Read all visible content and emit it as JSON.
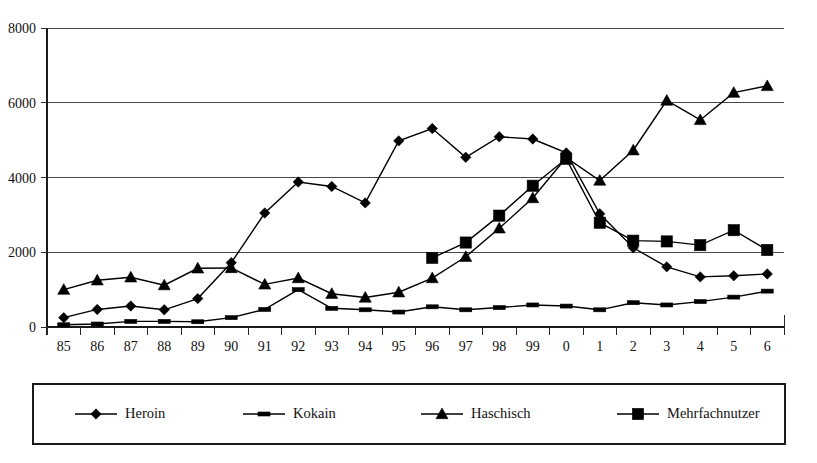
{
  "chart_data": {
    "type": "line",
    "title": "",
    "subtitle": "",
    "xlabel": "",
    "ylabel": "",
    "xlim_categories_count": 22,
    "ylim": [
      0,
      8000
    ],
    "y_ticks": [
      "0",
      "2000",
      "4000",
      "6000",
      "8000"
    ],
    "y_tick_values": [
      0,
      2000,
      4000,
      6000,
      8000
    ],
    "grid": "horizontal",
    "legend_position": "bottom",
    "categories": [
      "85",
      "86",
      "87",
      "88",
      "89",
      "90",
      "91",
      "92",
      "93",
      "94",
      "95",
      "96",
      "97",
      "98",
      "99",
      "0",
      "1",
      "2",
      "3",
      "4",
      "5",
      "6"
    ],
    "series": [
      {
        "name": "Heroin",
        "marker": "diamond",
        "values": [
          250,
          470,
          560,
          460,
          760,
          1720,
          3050,
          3880,
          3760,
          3320,
          4980,
          5310,
          4540,
          5090,
          5030,
          4660,
          3030,
          2120,
          1610,
          1340,
          1370,
          1420
        ]
      },
      {
        "name": "Kokain",
        "marker": "dash",
        "values": [
          60,
          80,
          150,
          150,
          140,
          250,
          470,
          1000,
          500,
          460,
          400,
          540,
          460,
          520,
          590,
          560,
          460,
          650,
          590,
          680,
          800,
          960
        ]
      },
      {
        "name": "Haschisch",
        "marker": "triangle",
        "values": [
          1000,
          1250,
          1330,
          1120,
          1570,
          1580,
          1140,
          1310,
          890,
          790,
          930,
          1310,
          1880,
          2640,
          3450,
          4530,
          3920,
          4730,
          6060,
          5540,
          6270,
          6450
        ]
      },
      {
        "name": "Mehrfachnutzer",
        "marker": "square",
        "values": [
          null,
          null,
          null,
          null,
          null,
          null,
          null,
          null,
          null,
          null,
          null,
          1850,
          2260,
          2980,
          3780,
          4500,
          2790,
          2310,
          2290,
          2190,
          2590,
          2060
        ]
      }
    ]
  },
  "legend": {
    "entries": [
      {
        "label": "Heroin",
        "marker": "diamond"
      },
      {
        "label": "Kokain",
        "marker": "dash"
      },
      {
        "label": "Haschisch",
        "marker": "triangle"
      },
      {
        "label": "Mehrfachnutzer",
        "marker": "square"
      }
    ]
  },
  "colors": {
    "series": "#000000",
    "grid": "#4a4a4a",
    "axis": "#1a1a1a",
    "background": "#ffffff"
  }
}
